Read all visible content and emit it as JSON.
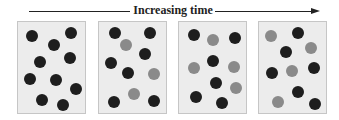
{
  "title": "Increasing time",
  "colors": {
    "dark_particle": "#1e1e1e",
    "gray_particle": "#8a8a8a",
    "box_fill": "#ececec",
    "box_border": "#c6c6c6",
    "arrow": "#222222"
  },
  "arrow": {
    "left_start": 29,
    "left_end": 130,
    "right_start": 215,
    "right_end": 312,
    "head_x": 311
  },
  "boxes": [
    {
      "left": 17,
      "particles": [
        {
          "x": 13.7,
          "y": 13.7,
          "type": "dark"
        },
        {
          "x": 53,
          "y": 10.7,
          "type": "dark"
        },
        {
          "x": 35.7,
          "y": 23,
          "type": "dark"
        },
        {
          "x": 22,
          "y": 39.7,
          "type": "dark"
        },
        {
          "x": 52.3,
          "y": 36.3,
          "type": "dark"
        },
        {
          "x": 12.3,
          "y": 57.3,
          "type": "dark"
        },
        {
          "x": 38.3,
          "y": 58,
          "type": "dark"
        },
        {
          "x": 58,
          "y": 67.3,
          "type": "dark"
        },
        {
          "x": 24,
          "y": 78,
          "type": "dark"
        },
        {
          "x": 44.7,
          "y": 83,
          "type": "dark"
        }
      ]
    },
    {
      "left": 98,
      "particles": [
        {
          "x": 16.3,
          "y": 10.7,
          "type": "dark"
        },
        {
          "x": 51.3,
          "y": 11.3,
          "type": "dark"
        },
        {
          "x": 26.6,
          "y": 23,
          "type": "gray"
        },
        {
          "x": 46,
          "y": 32.3,
          "type": "dark"
        },
        {
          "x": 12.3,
          "y": 40.7,
          "type": "dark"
        },
        {
          "x": 29,
          "y": 51.3,
          "type": "dark"
        },
        {
          "x": 55,
          "y": 52.3,
          "type": "gray"
        },
        {
          "x": 34.6,
          "y": 72,
          "type": "gray"
        },
        {
          "x": 14.6,
          "y": 79.7,
          "type": "dark"
        },
        {
          "x": 54.6,
          "y": 79,
          "type": "dark"
        }
      ]
    },
    {
      "left": 178,
      "particles": [
        {
          "x": 15,
          "y": 13,
          "type": "dark"
        },
        {
          "x": 34,
          "y": 18,
          "type": "gray"
        },
        {
          "x": 55.6,
          "y": 16.3,
          "type": "dark"
        },
        {
          "x": 34,
          "y": 38.7,
          "type": "dark"
        },
        {
          "x": 14.6,
          "y": 46.3,
          "type": "gray"
        },
        {
          "x": 54.6,
          "y": 44.7,
          "type": "gray"
        },
        {
          "x": 37.3,
          "y": 61.3,
          "type": "dark"
        },
        {
          "x": 57.3,
          "y": 66.3,
          "type": "gray"
        },
        {
          "x": 16.6,
          "y": 74.7,
          "type": "dark"
        },
        {
          "x": 43,
          "y": 81.3,
          "type": "dark"
        }
      ]
    },
    {
      "left": 258,
      "particles": [
        {
          "x": 12.3,
          "y": 13.7,
          "type": "gray"
        },
        {
          "x": 38.6,
          "y": 11.3,
          "type": "dark"
        },
        {
          "x": 52.3,
          "y": 25.7,
          "type": "gray"
        },
        {
          "x": 26.6,
          "y": 30.3,
          "type": "dark"
        },
        {
          "x": 12.6,
          "y": 50.7,
          "type": "dark"
        },
        {
          "x": 33.3,
          "y": 49,
          "type": "gray"
        },
        {
          "x": 55,
          "y": 46.3,
          "type": "dark"
        },
        {
          "x": 39,
          "y": 69.7,
          "type": "dark"
        },
        {
          "x": 19,
          "y": 79.7,
          "type": "gray"
        },
        {
          "x": 56.3,
          "y": 82,
          "type": "dark"
        }
      ]
    }
  ]
}
